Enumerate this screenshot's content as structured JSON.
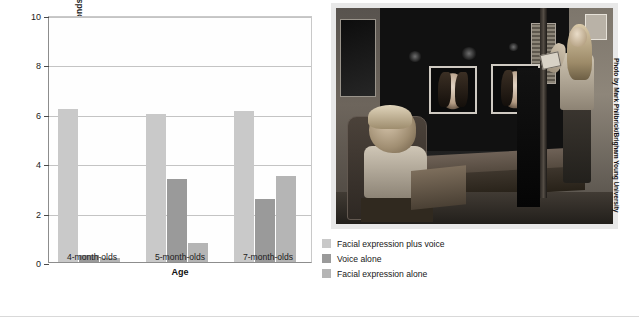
{
  "chart_data": {
    "type": "bar",
    "title": "",
    "xlabel": "Age",
    "ylabel": "Increase in looking time (seconds)",
    "categories": [
      "4-month-olds",
      "5-month-olds",
      "7-month-olds"
    ],
    "ylim": [
      0,
      10
    ],
    "yticks": [
      0,
      2,
      4,
      6,
      8,
      10
    ],
    "ytick_labels": [
      "0",
      "2",
      "4",
      "6",
      "8",
      "10"
    ],
    "grid": true,
    "legend_position": "bottom-right-outside",
    "series": [
      {
        "name": "Facial expression plus voice",
        "color": "#c9c9c9",
        "values": [
          6.2,
          6.0,
          6.1
        ]
      },
      {
        "name": "Voice alone",
        "color": "#9a9a9a",
        "values": [
          0.3,
          3.35,
          2.55
        ]
      },
      {
        "name": "Facial expression alone",
        "color": "#b5b5b5",
        "values": [
          0.15,
          0.75,
          3.5
        ]
      }
    ]
  },
  "legend": {
    "items": [
      {
        "label": "Facial expression plus voice",
        "color": "#c9c9c9"
      },
      {
        "label": "Voice alone",
        "color": "#9a9a9a"
      },
      {
        "label": "Facial expression alone",
        "color": "#b5b5b5"
      }
    ]
  },
  "photo": {
    "credit": "Photo by Mark Philbrick/Brigham Young University",
    "description": "Infant seated in a chair facing two video monitors showing a woman's face, with a researcher standing at the right side of a darkened testing room."
  }
}
